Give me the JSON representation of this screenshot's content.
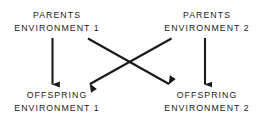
{
  "diagram": {
    "type": "cross-fostering-flow",
    "background_color": "#ffffff",
    "stroke_color": "#1a1a1a",
    "nodes": [
      {
        "id": "parents-1",
        "line_1": "PARENTS",
        "line_2": "ENVIRONMENT 1",
        "position": "top-left"
      },
      {
        "id": "parents-2",
        "line_1": "PARENTS",
        "line_2": "ENVIRONMENT 2",
        "position": "top-right"
      },
      {
        "id": "offspring-1",
        "line_1": "OFFSPRING",
        "line_2": "ENVIRONMENT 1",
        "position": "bottom-left"
      },
      {
        "id": "offspring-2",
        "line_1": "OFFSPRING",
        "line_2": "ENVIRONMENT 2",
        "position": "bottom-right"
      }
    ],
    "arrows": [
      {
        "id": "arrow-p1-to-o1",
        "from": "parents-1",
        "to": "offspring-1",
        "kind": "vertical"
      },
      {
        "id": "arrow-p1-to-o2",
        "from": "parents-1",
        "to": "offspring-2",
        "kind": "diagonal"
      },
      {
        "id": "arrow-p2-to-o1",
        "from": "parents-2",
        "to": "offspring-1",
        "kind": "diagonal"
      },
      {
        "id": "arrow-p2-to-o2",
        "from": "parents-2",
        "to": "offspring-2",
        "kind": "vertical"
      }
    ]
  }
}
